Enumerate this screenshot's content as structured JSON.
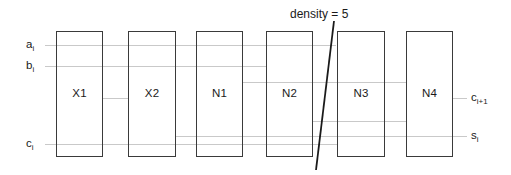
{
  "diagram": {
    "type": "block-schematic",
    "width": 511,
    "height": 175,
    "background_color": "#ffffff",
    "block_border_color": "#3a3a3a",
    "wire_color": "#c9c9c9",
    "text_color": "#1a1a1a",
    "blocks": [
      {
        "label": "X1",
        "x": 56,
        "y": 31,
        "width": 47,
        "height": 126
      },
      {
        "label": "X2",
        "x": 128,
        "y": 31,
        "width": 48,
        "height": 126
      },
      {
        "label": "N1",
        "x": 196,
        "y": 31,
        "width": 47,
        "height": 126
      },
      {
        "label": "N2",
        "x": 266,
        "y": 31,
        "width": 47,
        "height": 126
      },
      {
        "label": "N3",
        "x": 337,
        "y": 31,
        "width": 48,
        "height": 126
      },
      {
        "label": "N4",
        "x": 406,
        "y": 31,
        "width": 47,
        "height": 126
      }
    ],
    "wires": [
      {
        "name": "a-i-wire",
        "x1": 45,
        "x2": 336,
        "y": 45
      },
      {
        "name": "b-i-wire",
        "x1": 45,
        "x2": 267,
        "y": 66
      },
      {
        "name": "x1-x2-wire",
        "x1": 103,
        "x2": 129,
        "y": 98
      },
      {
        "name": "n1-n4-wire",
        "x1": 243,
        "x2": 407,
        "y": 82
      },
      {
        "name": "n2-n4-wire",
        "x1": 313,
        "x2": 407,
        "y": 121
      },
      {
        "name": "s-i-wire",
        "x1": 176,
        "x2": 467,
        "y": 136
      },
      {
        "name": "c-i-wire",
        "x1": 45,
        "x2": 338,
        "y": 144
      },
      {
        "name": "c-i-plus-1-wire",
        "x1": 453,
        "x2": 467,
        "y": 98
      }
    ],
    "input_labels": [
      {
        "name": "label-a-i",
        "base": "a",
        "sub": "i",
        "x": 26,
        "y": 39
      },
      {
        "name": "label-b-i",
        "base": "b",
        "sub": "i",
        "x": 26,
        "y": 60
      },
      {
        "name": "label-c-i",
        "base": "c",
        "sub": "i",
        "x": 26,
        "y": 138
      }
    ],
    "output_labels": [
      {
        "name": "label-c-i-plus-1",
        "base": "c",
        "sub": "i+1",
        "x": 471,
        "y": 92
      },
      {
        "name": "label-s-i",
        "base": "s",
        "sub": "i",
        "x": 471,
        "y": 130
      }
    ],
    "annotation": {
      "text": "density = 5",
      "x": 290,
      "y": 8,
      "line": {
        "x1": 334,
        "y1": 21,
        "x2": 316,
        "y2": 170
      }
    }
  }
}
